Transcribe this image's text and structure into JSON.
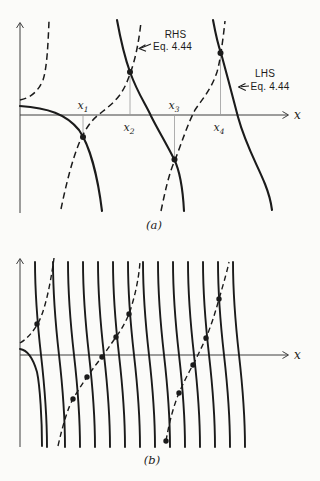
{
  "figure": {
    "equation_reference": "Eq. 4.44",
    "colors": {
      "ink": "#1b1b1b",
      "paper": "#fbfbf9",
      "guide": "#9a9a9a",
      "axis": "#3f3f3f"
    },
    "panels": [
      {
        "id": "a",
        "caption": "(a)",
        "dot_r": 3,
        "geometry": {
          "axes": [
            {
              "name": "y-axis",
              "line": "M20,213 L20,23",
              "arrow": "M16.5,28 L20,22.5 L23.5,28"
            },
            {
              "name": "x-axis",
              "line": "M20,115 L288,115",
              "arrow": "M282.5,111.5 L288.5,115 L282.5,118.5"
            }
          ],
          "guides": [
            [
              83,
              115,
              137
            ],
            [
              130,
              72,
              115
            ],
            [
              174.5,
              115,
              159.5
            ],
            [
              220.5,
              53,
              115
            ]
          ],
          "solid_paths": [
            "M20,106 C48,108 66,114 79,130 C90,146 98,178 102,211",
            "M117,20 C121,42 125,58 130,72 C138,94 145,103 151,116 C158,130 166,143 174,159 C180,171 183,192 184,211",
            "M213,20 C216,36 218,45 221,53 C227,75 232,94 238,117 C246,146 257,164 265,184 C269,194 271,202 272,210"
          ],
          "dashed_paths": [
            "M20,100 C30,98 38,92 43,80 C47,68 48,45 49,21",
            "M61,209 C66,185 72,160 80,141 C85,130 90,122 97,116 C104,110 112,105 119,96 C125,88 128,80 131,71 C136,57 139,40 141,22",
            "M161,211 C165,192 169,173 175,160 C182,142 188,123 195,110 C203,98 211,90 217,72 C220,62 223,40 225,21"
          ],
          "dots": [
            [
              83,
              137
            ],
            [
              130,
              72
            ],
            [
              174.5,
              159.5
            ],
            [
              220.5,
              53
            ]
          ],
          "pointer_arrows": [
            {
              "name": "rhs-pointer-arrow",
              "line": "M151,44 L140.5,48.2",
              "head": "M145.5,44.8 L139,48.5 L146,51.3"
            },
            {
              "name": "lhs-pointer-arrow",
              "line": "M249,86 L241,86.8",
              "head": "M245.5,83.4 L238.5,87 L245.8,90.4"
            }
          ],
          "texts": [
            {
              "name": "rhs-label-line1",
              "x": 175.5,
              "y": 38,
              "cls": "t-sans",
              "anchor": "middle",
              "text": "RHS"
            },
            {
              "name": "rhs-label-line2",
              "x": 172.5,
              "y": 50,
              "cls": "t-sans",
              "anchor": "middle",
              "text": "Eq. 4.44"
            },
            {
              "name": "lhs-label-line1",
              "x": 265,
              "y": 77,
              "cls": "t-sans",
              "anchor": "middle",
              "text": "LHS"
            },
            {
              "name": "lhs-label-line2",
              "x": 270,
              "y": 90,
              "cls": "t-sans",
              "anchor": "middle",
              "text": "Eq. 4.44"
            },
            {
              "name": "tick-label-x1",
              "x": 83,
              "y": 109,
              "cls": "t-math",
              "anchor": "middle",
              "main": "x",
              "sub": "1"
            },
            {
              "name": "tick-label-x2",
              "x": 129,
              "y": 131,
              "cls": "t-math",
              "anchor": "middle",
              "main": "x",
              "sub": "2"
            },
            {
              "name": "tick-label-x3",
              "x": 174,
              "y": 109,
              "cls": "t-math",
              "anchor": "middle",
              "main": "x",
              "sub": "3"
            },
            {
              "name": "tick-label-x4",
              "x": 219,
              "y": 131,
              "cls": "t-math",
              "anchor": "middle",
              "main": "x",
              "sub": "4"
            },
            {
              "name": "x-axis-label",
              "x": 294,
              "y": 119,
              "cls": "t-math-axis",
              "anchor": "start",
              "text": "x"
            },
            {
              "name": "panel-caption",
              "x": 154,
              "y": 229,
              "cls": "t-cap",
              "anchor": "middle",
              "text": "(a)"
            }
          ]
        }
      },
      {
        "id": "b",
        "caption": "(b)",
        "dot_r": 2.7,
        "geometry": {
          "axes": [
            {
              "name": "y-axis",
              "line": "M20,447 L20,259",
              "arrow": "M16.5,264 L20,258.5 L23.5,264"
            },
            {
              "name": "x-axis",
              "line": "M20,355 L288,355",
              "arrow": "M282.5,351.5 L288.5,355 L282.5,358.5"
            }
          ],
          "guides": [],
          "solid_paths": [
            "M20,349 C27,350 33,358 37,372 C40,386 42,420 42,446"
          ],
          "steep_family": {
            "axis_x": [
              41,
              59,
              74,
              89,
              104,
              119,
              134,
              149,
              164,
              179,
              194,
              209,
              224,
              239
            ],
            "top_y": 262,
            "bottom_y": 447,
            "lean": 6,
            "c1_y": 342,
            "c2_y": 368
          },
          "dashed_paths": [
            "M20,343 C27,339 32,333 37,325 C44,314 50,288 54,258",
            "M58,446 Q66,411 73,399 Q80,387 87,377 Q94,367 102,357 Q109,347 116,337 Q124,326 129,314 Q138,288 140,262",
            "M166,441 Q171,412 179,393 Q186,377 193,365 Q200,351 206,338 Q213,321 219,299 Q227,272 229,262"
          ],
          "dots": [
            [
              37,
              324
            ],
            [
              73,
              399
            ],
            [
              87,
              377
            ],
            [
              102,
              357
            ],
            [
              116,
              337
            ],
            [
              129,
              314
            ],
            [
              166,
              441
            ],
            [
              179,
              393
            ],
            [
              193,
              365
            ],
            [
              206,
              338
            ],
            [
              219,
              299
            ]
          ],
          "pointer_arrows": [],
          "texts": [
            {
              "name": "x-axis-label",
              "x": 294,
              "y": 359,
              "cls": "t-math-axis",
              "anchor": "start",
              "text": "x"
            },
            {
              "name": "panel-caption",
              "x": 152,
              "y": 464,
              "cls": "t-cap",
              "anchor": "middle",
              "text": "(b)"
            }
          ]
        }
      }
    ]
  }
}
